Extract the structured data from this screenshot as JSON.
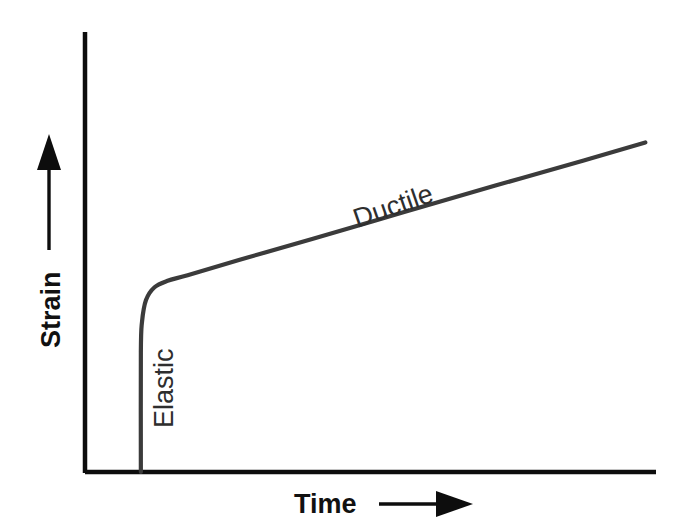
{
  "figure": {
    "background_color": "#ffffff",
    "axis_color": "#0d0d0d",
    "curve_color": "#3b3b3b",
    "label_color": "#111111",
    "inline_label_color": "#2e2e2e",
    "y_axis_label": "Strain",
    "x_axis_label": "Time",
    "y_axis_arrow_icon": "arrow-up-icon",
    "x_axis_arrow_icon": "arrow-right-icon",
    "annotations": {
      "elastic": "Elastic",
      "ductile": "Ductile"
    }
  },
  "chart_data": {
    "type": "line",
    "title": "",
    "xlabel": "Time",
    "ylabel": "Strain",
    "xlim": [
      0,
      1
    ],
    "ylim": [
      0,
      1
    ],
    "grid": false,
    "legend": "none",
    "axis_ticks": {
      "x": [],
      "y": []
    },
    "series": [
      {
        "name": "Creep strain",
        "comment": "Normalized coordinates: x left-to-right 0-1, y bottom-to-top 0-1",
        "x": [
          0.098,
          0.098,
          0.1,
          0.107,
          0.122,
          0.145,
          0.18,
          0.27,
          0.4,
          0.56,
          0.72,
          0.875,
          0.983
        ],
        "y": [
          0.0,
          0.3,
          0.375,
          0.43,
          0.462,
          0.478,
          0.492,
          0.53,
          0.583,
          0.65,
          0.716,
          0.779,
          0.824
        ]
      }
    ],
    "annotations": [
      {
        "text": "Elastic",
        "x": 0.118,
        "y": 0.155,
        "rotation": -90,
        "description": "labels the near-vertical instantaneous elastic strain segment"
      },
      {
        "text": "Ductile",
        "x": 0.54,
        "y": 0.595,
        "rotation": -19,
        "description": "labels the steady linear creep / ductile segment"
      }
    ]
  }
}
